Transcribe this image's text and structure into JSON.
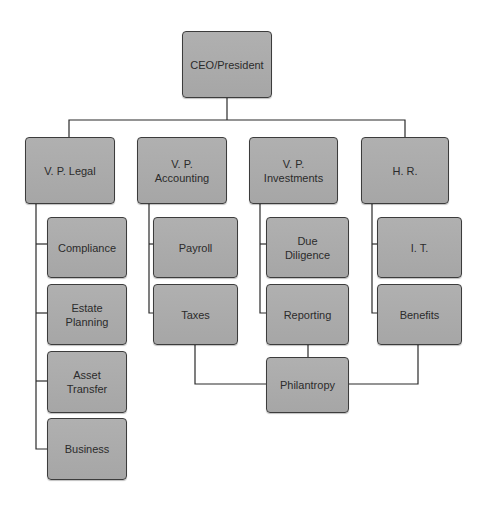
{
  "chart": {
    "title": "",
    "colors": {
      "node_fill": "#aaaaaa",
      "node_border": "#3c3c3c",
      "text": "#2b2b2b",
      "line": "#2a2a2a",
      "background": "#ffffff"
    },
    "root": {
      "id": "ceo",
      "label": "CEO/President"
    },
    "vps": [
      {
        "id": "vp-legal",
        "label": "V. P. Legal"
      },
      {
        "id": "vp-accounting",
        "label": "V. P.\nAccounting"
      },
      {
        "id": "vp-investments",
        "label": "V. P.\nInvestments"
      },
      {
        "id": "hr",
        "label": "H. R."
      }
    ],
    "children": {
      "legal": [
        {
          "id": "compliance",
          "label": "Compliance"
        },
        {
          "id": "estate-planning",
          "label": "Estate\nPlanning"
        },
        {
          "id": "asset-transfer",
          "label": "Asset\nTransfer"
        },
        {
          "id": "business",
          "label": "Business"
        }
      ],
      "accounting": [
        {
          "id": "payroll",
          "label": "Payroll"
        },
        {
          "id": "taxes",
          "label": "Taxes"
        }
      ],
      "investments": [
        {
          "id": "due-diligence",
          "label": "Due\nDiligence"
        },
        {
          "id": "reporting",
          "label": "Reporting"
        }
      ],
      "hr": [
        {
          "id": "it",
          "label": "I. T."
        },
        {
          "id": "benefits",
          "label": "Benefits"
        }
      ]
    },
    "shared": {
      "id": "philanthropy",
      "label": "Philantropy",
      "linked_from": [
        "Taxes",
        "Reporting",
        "Benefits"
      ]
    }
  }
}
